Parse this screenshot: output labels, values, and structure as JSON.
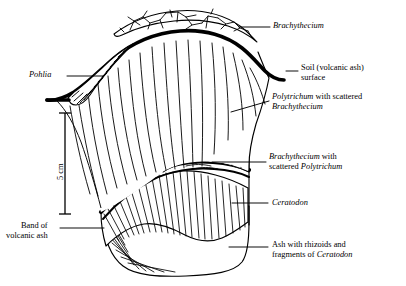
{
  "figure": {
    "kind": "cross-section-diagram",
    "scale_bar": {
      "label": "5 cm",
      "orientation": "vertical"
    }
  },
  "labels": {
    "brachythecium_cap": {
      "parts": [
        {
          "text": "Brachythecium",
          "style": "italic"
        }
      ]
    },
    "soil_surface": {
      "lines": [
        {
          "parts": [
            {
              "text": "Soil (volcanic ash)",
              "style": "roman"
            }
          ]
        },
        {
          "parts": [
            {
              "text": "surface",
              "style": "roman"
            }
          ]
        }
      ]
    },
    "polytrichum_zone": {
      "lines": [
        {
          "parts": [
            {
              "text": "Polytrichum",
              "style": "italic"
            },
            {
              "text": " with scattered",
              "style": "roman"
            }
          ]
        },
        {
          "parts": [
            {
              "text": "Brachythecium",
              "style": "italic"
            }
          ]
        }
      ]
    },
    "brachythecium_wedge": {
      "lines": [
        {
          "parts": [
            {
              "text": "Brachythecium",
              "style": "italic"
            },
            {
              "text": " with",
              "style": "roman"
            }
          ]
        },
        {
          "parts": [
            {
              "text": "scattered ",
              "style": "roman"
            },
            {
              "text": "Polytrichum",
              "style": "italic"
            }
          ]
        }
      ]
    },
    "ceratodon_zone": {
      "parts": [
        {
          "text": "Ceratodon",
          "style": "italic"
        }
      ]
    },
    "ash_rhizoids": {
      "lines": [
        {
          "parts": [
            {
              "text": "Ash with rhizoids and",
              "style": "roman"
            }
          ]
        },
        {
          "parts": [
            {
              "text": "fragments of ",
              "style": "roman"
            },
            {
              "text": "Ceratodon",
              "style": "italic"
            }
          ]
        }
      ]
    },
    "pohlia_zone": {
      "parts": [
        {
          "text": "Pohlia",
          "style": "italic"
        }
      ]
    },
    "volcanic_ash_band": {
      "lines": [
        {
          "parts": [
            {
              "text": "Band of",
              "style": "roman"
            }
          ]
        },
        {
          "parts": [
            {
              "text": "volcanic ash",
              "style": "roman"
            }
          ]
        }
      ]
    }
  },
  "colors": {
    "ink": "#000000",
    "paper": "#ffffff"
  }
}
